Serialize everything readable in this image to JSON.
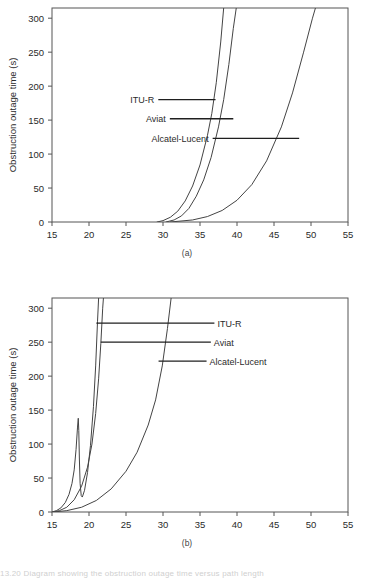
{
  "figure": {
    "sub_a": "(a)",
    "sub_b": "(b)",
    "caption": "13.20   Diagram showing the obstruction outage time versus path length"
  },
  "chart_data": [
    {
      "id": "a",
      "type": "line",
      "title": "",
      "xlabel": "Path length (miles)",
      "ylabel": "Obstruction outage time (s)",
      "xlim": [
        15,
        55
      ],
      "ylim": [
        0,
        315
      ],
      "xticks": [
        15,
        20,
        25,
        30,
        35,
        40,
        45,
        50,
        55
      ],
      "yticks": [
        0,
        50,
        100,
        150,
        200,
        250,
        300
      ],
      "grid": false,
      "legend_position": "inline-annotation-left",
      "series": [
        {
          "name": "ITU-R",
          "points": [
            [
              29.2,
              0
            ],
            [
              30.0,
              2
            ],
            [
              31.0,
              7
            ],
            [
              32.0,
              16
            ],
            [
              33.0,
              31
            ],
            [
              34.0,
              53
            ],
            [
              35.0,
              84
            ],
            [
              36.0,
              127
            ],
            [
              36.6,
              160
            ],
            [
              37.2,
              205
            ],
            [
              37.8,
              265
            ],
            [
              38.2,
              315
            ]
          ]
        },
        {
          "name": "Aviat",
          "points": [
            [
              30.4,
              0
            ],
            [
              31.5,
              3
            ],
            [
              32.5,
              9
            ],
            [
              33.5,
              20
            ],
            [
              34.5,
              38
            ],
            [
              35.5,
              62
            ],
            [
              36.5,
              95
            ],
            [
              37.5,
              140
            ],
            [
              38.2,
              180
            ],
            [
              38.9,
              232
            ],
            [
              39.5,
              285
            ],
            [
              39.9,
              315
            ]
          ]
        },
        {
          "name": "Alcatel-Lucent",
          "points": [
            [
              31.0,
              0
            ],
            [
              34.0,
              3
            ],
            [
              36.0,
              8
            ],
            [
              38.0,
              17
            ],
            [
              40.0,
              32
            ],
            [
              42.0,
              55
            ],
            [
              44.0,
              90
            ],
            [
              46.0,
              140
            ],
            [
              47.5,
              190
            ],
            [
              49.0,
              250
            ],
            [
              50.2,
              300
            ],
            [
              50.6,
              315
            ]
          ]
        }
      ],
      "annotations": [
        {
          "label": "ITU-R",
          "y": 180,
          "x_end": 37.1,
          "label_side": "left"
        },
        {
          "label": "Aviat",
          "y": 152,
          "x_end": 39.5,
          "label_side": "left"
        },
        {
          "label": "Alcatel-Lucent",
          "y": 123,
          "x_end": 48.4,
          "label_side": "left"
        }
      ]
    },
    {
      "id": "b",
      "type": "line",
      "title": "",
      "xlabel": "Path length (miles)",
      "ylabel": "Obstruction outage time (s)",
      "xlim": [
        15,
        55
      ],
      "ylim": [
        0,
        315
      ],
      "xticks": [
        15,
        20,
        25,
        30,
        35,
        40,
        45,
        50,
        55
      ],
      "yticks": [
        0,
        50,
        100,
        150,
        200,
        250,
        300
      ],
      "grid": false,
      "legend_position": "inline-annotation-right",
      "series": [
        {
          "name": "ITU-R",
          "points": [
            [
              15.0,
              0
            ],
            [
              15.6,
              2
            ],
            [
              16.2,
              6
            ],
            [
              16.8,
              14
            ],
            [
              17.3,
              26
            ],
            [
              17.7,
              42
            ],
            [
              18.0,
              62
            ],
            [
              18.25,
              92
            ],
            [
              18.45,
              125
            ],
            [
              18.55,
              138
            ],
            [
              18.62,
              120
            ],
            [
              18.7,
              78
            ],
            [
              18.8,
              42
            ],
            [
              18.95,
              24
            ],
            [
              19.1,
              22
            ],
            [
              19.4,
              32
            ],
            [
              19.8,
              58
            ],
            [
              20.2,
              98
            ],
            [
              20.6,
              155
            ],
            [
              20.9,
              215
            ],
            [
              21.15,
              280
            ],
            [
              21.3,
              315
            ]
          ]
        },
        {
          "name": "Aviat",
          "points": [
            [
              15.1,
              0
            ],
            [
              16.0,
              2
            ],
            [
              17.0,
              7
            ],
            [
              18.0,
              18
            ],
            [
              19.0,
              38
            ],
            [
              19.8,
              66
            ],
            [
              20.4,
              100
            ],
            [
              20.9,
              145
            ],
            [
              21.3,
              196
            ],
            [
              21.6,
              248
            ],
            [
              21.85,
              300
            ],
            [
              21.95,
              315
            ]
          ]
        },
        {
          "name": "Alcatel-Lucent",
          "points": [
            [
              15.2,
              0
            ],
            [
              17.0,
              2
            ],
            [
              19.0,
              7
            ],
            [
              21.0,
              17
            ],
            [
              23.0,
              34
            ],
            [
              25.0,
              60
            ],
            [
              26.5,
              88
            ],
            [
              28.0,
              128
            ],
            [
              29.0,
              165
            ],
            [
              29.9,
              215
            ],
            [
              30.6,
              270
            ],
            [
              31.1,
              315
            ]
          ]
        }
      ],
      "annotations": [
        {
          "label": "ITU-R",
          "y": 278,
          "x_start": 21.0,
          "label_side": "right"
        },
        {
          "label": "Aviat",
          "y": 250,
          "x_start": 21.6,
          "label_side": "right"
        },
        {
          "label": "Alcatel-Lucent",
          "y": 222,
          "x_start": 29.4,
          "label_side": "right"
        }
      ]
    }
  ]
}
